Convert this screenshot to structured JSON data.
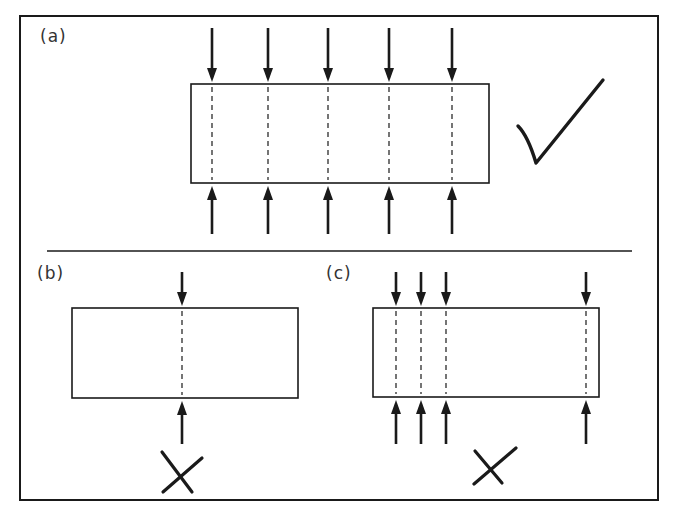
{
  "colors": {
    "stroke": "#1a1a1a",
    "label": "#333333",
    "background": "#ffffff"
  },
  "frame": {
    "x": 20,
    "y": 16,
    "w": 638,
    "h": 484
  },
  "separator": {
    "x1": 47,
    "x2": 632,
    "y": 251
  },
  "panels": [
    {
      "id": "a",
      "label": "(a)",
      "label_pos": {
        "x": 40,
        "y": 28
      },
      "verdict": "correct",
      "verdict_icon": "checkmark-icon",
      "box": {
        "x": 191,
        "y": 84,
        "w": 298,
        "h": 99
      },
      "load_positions_x": [
        212,
        268,
        328,
        389,
        452
      ],
      "top_arrow": {
        "y1": 28,
        "y2": 82
      },
      "bottom_arrow": {
        "y1": 186,
        "y2": 234
      },
      "mark": {
        "type": "check",
        "points": [
          [
            518,
            126
          ],
          [
            536,
            163
          ],
          [
            603,
            80
          ]
        ]
      }
    },
    {
      "id": "b",
      "label": "(b)",
      "label_pos": {
        "x": 37,
        "y": 265
      },
      "verdict": "incorrect",
      "verdict_icon": "cross-icon",
      "box": {
        "x": 72,
        "y": 308,
        "w": 226,
        "h": 90
      },
      "load_positions_x": [
        182
      ],
      "top_arrow": {
        "y1": 272,
        "y2": 306
      },
      "bottom_arrow": {
        "y1": 401,
        "y2": 444
      },
      "mark": {
        "type": "cross",
        "lines": [
          [
            [
              162,
              452
            ],
            [
              192,
              492
            ]
          ],
          [
            [
              202,
              458
            ],
            [
              163,
              492
            ]
          ]
        ]
      }
    },
    {
      "id": "c",
      "label": "(c)",
      "label_pos": {
        "x": 326,
        "y": 265
      },
      "verdict": "incorrect",
      "verdict_icon": "cross-icon",
      "box": {
        "x": 373,
        "y": 308,
        "w": 226,
        "h": 89
      },
      "load_positions_x": [
        396,
        421,
        446,
        586
      ],
      "top_arrow": {
        "y1": 272,
        "y2": 306
      },
      "bottom_arrow": {
        "y1": 400,
        "y2": 444
      },
      "mark": {
        "type": "cross",
        "lines": [
          [
            [
              475,
              451
            ],
            [
              502,
              483
            ]
          ],
          [
            [
              516,
              448
            ],
            [
              474,
              484
            ]
          ]
        ]
      }
    }
  ]
}
